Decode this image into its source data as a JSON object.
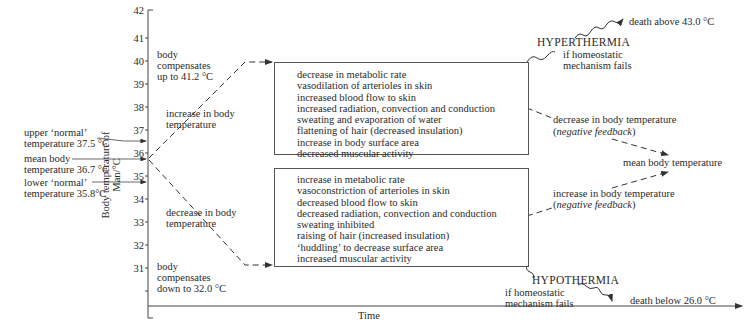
{
  "axis": {
    "ylabel_line1": "Body temperature of",
    "ylabel_line2": "Man/°C",
    "xlabel": "Time",
    "ticks": [
      "42",
      "41",
      "40",
      "39",
      "38",
      "37",
      "36",
      "35",
      "34",
      "33",
      "32",
      "31"
    ]
  },
  "left_labels": {
    "upper_normal_1": "upper ‘normal’",
    "upper_normal_2": "temperature 37.5 °C",
    "mean_1": "mean body",
    "mean_2": "temperature 36.7 °C",
    "lower_normal_1": "lower ‘normal’",
    "lower_normal_2": "temperature 35.8°C"
  },
  "axis_notes": {
    "upper_1": "body",
    "upper_2": "compensates",
    "upper_3": "up to 41.2 °C",
    "lower_1": "body",
    "lower_2": "compensates",
    "lower_3": "down to 32.0 °C"
  },
  "branches": {
    "increase_1": "increase in body",
    "increase_2": "temperature",
    "decrease_1": "decrease in body",
    "decrease_2": "temperature"
  },
  "box_hot": [
    "decrease in metabolic rate",
    "vasodilation of arterioles in skin",
    "increased blood flow to skin",
    "increased radiation, convection and conduction",
    "sweating and evaporation of water",
    "flattening of hair (decreased insulation)",
    "increase in body surface area",
    "decreased muscular activity"
  ],
  "box_cold": [
    "increase in metabolic rate",
    "vasoconstriction of arterioles in skin",
    "decreased blood flow to skin",
    "decreased radiation, convection and conduction",
    "sweating inhibited",
    "raising of hair (increased insulation)",
    "‘huddling’ to decrease surface area",
    "increased muscular activity"
  ],
  "right": {
    "hyperthermia": "HYPERTHERMIA",
    "hyper_fail_1": "if homeostatic",
    "hyper_fail_2": "mechanism fails",
    "death_above": "death above 43.0 °C",
    "feedback_dec_1": "decrease in body temperature",
    "feedback_dec_2": "negative feedback",
    "mean_body": "mean body temperature",
    "feedback_inc_1": "increase in body temperature",
    "feedback_inc_2": "negative feedback",
    "hypothermia": "HYPOTHERMIA",
    "hypo_fail_1": "if homeostatic",
    "hypo_fail_2": "mechanism fails",
    "death_below": "death below 26.0 °C"
  }
}
